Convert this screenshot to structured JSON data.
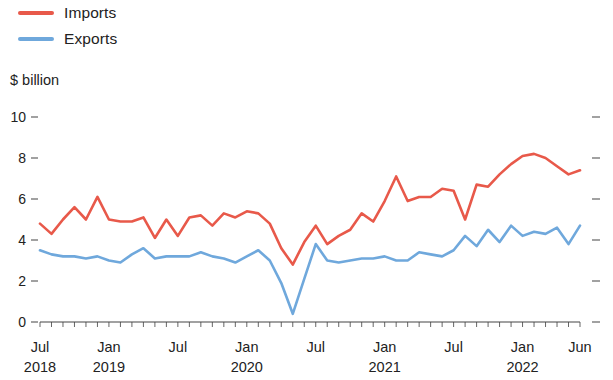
{
  "legend": {
    "position": "top-left",
    "entries": [
      {
        "label": "Imports",
        "color": "#e8594a",
        "name": "imports"
      },
      {
        "label": "Exports",
        "color": "#6fa8dc",
        "name": "exports"
      }
    ]
  },
  "axis": {
    "unit_label": "$ billion",
    "y_ticks": [
      "0",
      "2",
      "4",
      "6",
      "8",
      "10"
    ],
    "x_tick_labels": [
      {
        "month": "Jul",
        "year": "2018"
      },
      {
        "month": "Jan",
        "year": "2019"
      },
      {
        "month": "Jul",
        "year": ""
      },
      {
        "month": "Jan",
        "year": "2020"
      },
      {
        "month": "Jul",
        "year": ""
      },
      {
        "month": "Jan",
        "year": "2021"
      },
      {
        "month": "Jul",
        "year": ""
      },
      {
        "month": "Jan",
        "year": "2022"
      },
      {
        "month": "Jun",
        "year": ""
      }
    ]
  },
  "chart_data": {
    "type": "line",
    "title": "",
    "subtitle": "",
    "xlabel": "",
    "ylabel": "$ billion",
    "ylim": [
      0,
      10
    ],
    "yticks": [
      0,
      2,
      4,
      6,
      8,
      10
    ],
    "grid": false,
    "legend_position": "top-left",
    "x": [
      "Jul 2018",
      "Aug 2018",
      "Sep 2018",
      "Oct 2018",
      "Nov 2018",
      "Dec 2018",
      "Jan 2019",
      "Feb 2019",
      "Mar 2019",
      "Apr 2019",
      "May 2019",
      "Jun 2019",
      "Jul 2019",
      "Aug 2019",
      "Sep 2019",
      "Oct 2019",
      "Nov 2019",
      "Dec 2019",
      "Jan 2020",
      "Feb 2020",
      "Mar 2020",
      "Apr 2020",
      "May 2020",
      "Jun 2020",
      "Jul 2020",
      "Aug 2020",
      "Sep 2020",
      "Oct 2020",
      "Nov 2020",
      "Dec 2020",
      "Jan 2021",
      "Feb 2021",
      "Mar 2021",
      "Apr 2021",
      "May 2021",
      "Jun 2021",
      "Jul 2021",
      "Aug 2021",
      "Sep 2021",
      "Oct 2021",
      "Nov 2021",
      "Dec 2021",
      "Jan 2022",
      "Feb 2022",
      "Mar 2022",
      "Apr 2022",
      "May 2022",
      "Jun 2022"
    ],
    "series": [
      {
        "name": "Imports",
        "color": "#e8594a",
        "values": [
          4.8,
          4.3,
          5.0,
          5.6,
          5.0,
          6.1,
          5.0,
          4.9,
          4.9,
          5.1,
          4.1,
          5.0,
          4.2,
          5.1,
          5.2,
          4.7,
          5.3,
          5.1,
          5.4,
          5.3,
          4.8,
          3.6,
          2.8,
          3.9,
          4.7,
          3.8,
          4.2,
          4.5,
          5.3,
          4.9,
          5.9,
          7.1,
          5.9,
          6.1,
          6.1,
          6.5,
          6.4,
          5.0,
          6.7,
          6.6,
          7.2,
          7.7,
          8.1,
          8.2,
          8.0,
          7.6,
          7.2,
          7.4
        ]
      },
      {
        "name": "Exports",
        "color": "#6fa8dc",
        "values": [
          3.5,
          3.3,
          3.2,
          3.2,
          3.1,
          3.2,
          3.0,
          2.9,
          3.3,
          3.6,
          3.1,
          3.2,
          3.2,
          3.2,
          3.4,
          3.2,
          3.1,
          2.9,
          3.2,
          3.5,
          3.0,
          1.9,
          0.4,
          2.1,
          3.8,
          3.0,
          2.9,
          3.0,
          3.1,
          3.1,
          3.2,
          3.0,
          3.0,
          3.4,
          3.3,
          3.2,
          3.5,
          4.2,
          3.7,
          4.5,
          3.9,
          4.7,
          4.2,
          4.4,
          4.3,
          4.6,
          3.8,
          4.7
        ]
      }
    ]
  }
}
